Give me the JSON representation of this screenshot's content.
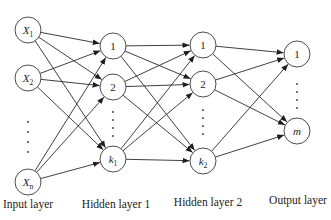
{
  "diagram": {
    "layers": [
      {
        "id": "input",
        "label": "Input layer",
        "x": 28,
        "label_y": 206,
        "nodes": [
          {
            "id": "x1",
            "text": "X",
            "sub": "1",
            "italic": true,
            "y": 30
          },
          {
            "id": "x2",
            "text": "X",
            "sub": "2",
            "italic": true,
            "y": 78
          },
          {
            "id": "xn",
            "text": "X",
            "sub": "n",
            "italic": true,
            "y": 182
          }
        ],
        "ellipsis_y": [
          122,
          132,
          142,
          152
        ]
      },
      {
        "id": "hidden1",
        "label": "Hidden layer 1",
        "x": 113,
        "label_y": 206,
        "nodes": [
          {
            "id": "h1_1",
            "text": "1",
            "sub": "",
            "italic": false,
            "y": 46
          },
          {
            "id": "h1_2",
            "text": "2",
            "sub": "",
            "italic": false,
            "y": 87
          },
          {
            "id": "h1_k1",
            "text": "k",
            "sub": "1",
            "italic": true,
            "y": 159
          }
        ],
        "ellipsis_y": [
          112,
          120,
          128,
          136
        ]
      },
      {
        "id": "hidden2",
        "label": "Hidden layer 2",
        "x": 203,
        "label_y": 203,
        "nodes": [
          {
            "id": "h2_1",
            "text": "1",
            "sub": "",
            "italic": false,
            "y": 45
          },
          {
            "id": "h2_2",
            "text": "2",
            "sub": "",
            "italic": false,
            "y": 84
          },
          {
            "id": "h2_k2",
            "text": "k",
            "sub": "2",
            "italic": true,
            "y": 161
          }
        ],
        "ellipsis_y": [
          110,
          118,
          126,
          134
        ]
      },
      {
        "id": "output",
        "label": "Output layer",
        "x": 297,
        "label_y": 201,
        "nodes": [
          {
            "id": "o1",
            "text": "1",
            "sub": "",
            "italic": false,
            "y": 54
          },
          {
            "id": "om",
            "text": "m",
            "sub": "",
            "italic": true,
            "y": 131
          }
        ],
        "ellipsis_y": [
          84,
          92,
          100,
          108
        ]
      }
    ],
    "node_radius": 13,
    "connectivity": "fully-connected",
    "edge_color": "#2a2a2a"
  },
  "labels": {
    "input": "Input layer",
    "hidden1": "Hidden layer 1",
    "hidden2": "Hidden layer 2",
    "output": "Output layer"
  }
}
